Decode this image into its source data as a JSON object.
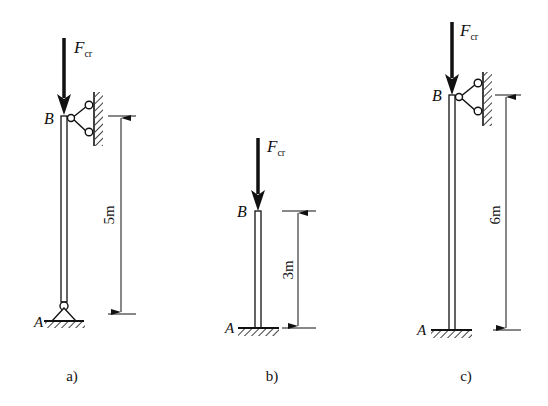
{
  "diagram": {
    "type": "column buckling schematic",
    "colors": {
      "ink": "#111111",
      "background": "#ffffff"
    },
    "panels": [
      {
        "id": "a",
        "caption": "a)",
        "load_label": "F",
        "load_subscript": "cr",
        "top_label": "B",
        "bottom_label": "A",
        "length_label": "5m",
        "top_support": "roller-link to wall (hinged)",
        "bottom_support": "pinned"
      },
      {
        "id": "b",
        "caption": "b)",
        "load_label": "F",
        "load_subscript": "cr",
        "top_label": "B",
        "bottom_label": "A",
        "length_label": "3m",
        "top_support": "free",
        "bottom_support": "fixed"
      },
      {
        "id": "c",
        "caption": "c)",
        "load_label": "F",
        "load_subscript": "cr",
        "top_label": "B",
        "bottom_label": "A",
        "length_label": "6m",
        "top_support": "roller-link to wall (hinged)",
        "bottom_support": "fixed"
      }
    ]
  }
}
